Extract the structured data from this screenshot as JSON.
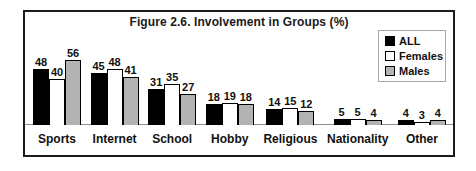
{
  "figure": {
    "title": "Figure 2.6. Involvement in Groups (%)"
  },
  "legend": {
    "items": [
      {
        "label": "ALL",
        "color": "#000000"
      },
      {
        "label": "Females",
        "color": "#ffffff"
      },
      {
        "label": "Males",
        "color": "#b3b3b3"
      }
    ]
  },
  "chart_data": {
    "type": "bar",
    "title": "Figure 2.6. Involvement in Groups (%)",
    "categories": [
      "Sports",
      "Internet",
      "School",
      "Hobby",
      "Religious",
      "Nationality",
      "Other"
    ],
    "series": [
      {
        "name": "ALL",
        "color": "#000000",
        "values": [
          48,
          45,
          31,
          18,
          14,
          5,
          4
        ]
      },
      {
        "name": "Females",
        "color": "#ffffff",
        "values": [
          40,
          48,
          35,
          19,
          15,
          5,
          3
        ]
      },
      {
        "name": "Males",
        "color": "#b3b3b3",
        "values": [
          56,
          41,
          27,
          18,
          12,
          4,
          4
        ]
      }
    ],
    "ylim": [
      0,
      60
    ],
    "value_labels": true,
    "grid": false,
    "legend_position": "top-right"
  }
}
